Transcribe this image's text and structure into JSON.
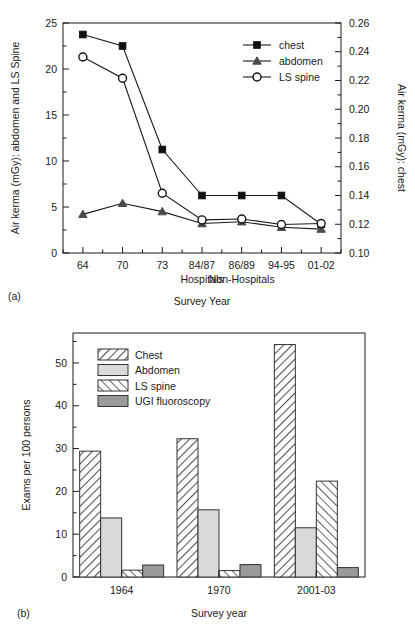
{
  "figure": {
    "panel_a_label": "(a)",
    "panel_b_label": "(b)"
  },
  "chart_data": [
    {
      "id": "panel_a",
      "type": "line",
      "title": "",
      "xlabel": "Survey Year",
      "ylabel": "Air kerma (mGy): abdomen and LS Spine",
      "y2label": "Air kerma (mGy): chest",
      "categories": [
        "64",
        "70",
        "73",
        "84/87",
        "86/89",
        "94-95",
        "01-02"
      ],
      "group_labels": [
        {
          "text": "Hospitals",
          "under": "84/87"
        },
        {
          "text": "Non-Hospitals",
          "under": "86/89"
        }
      ],
      "ylim": [
        0,
        25
      ],
      "yticks": [
        0,
        5,
        10,
        15,
        20,
        25
      ],
      "ytick_labels": [
        "0",
        "5",
        "10",
        "15",
        "20",
        "25"
      ],
      "y2lim": [
        0.1,
        0.26
      ],
      "y2ticks": [
        0.1,
        0.12,
        0.14,
        0.16,
        0.18,
        0.2,
        0.22,
        0.24,
        0.26
      ],
      "y2tick_labels": [
        "0.10",
        "0.12",
        "0.14",
        "0.16",
        "0.18",
        "0.20",
        "0.22",
        "0.24",
        "0.26"
      ],
      "grid": false,
      "legend_position": "top-right",
      "series": [
        {
          "name": "chest",
          "marker": "filled-square",
          "axis": "right",
          "values": [
            0.252,
            0.244,
            0.172,
            0.14,
            0.14,
            0.14,
            0.12
          ]
        },
        {
          "name": "abdomen",
          "marker": "filled-triangle",
          "axis": "left",
          "values": [
            4.2,
            5.4,
            4.5,
            3.2,
            3.4,
            2.8,
            2.6
          ]
        },
        {
          "name": "LS spine",
          "marker": "open-circle",
          "axis": "left",
          "values": [
            21.3,
            19.0,
            6.5,
            3.6,
            3.7,
            3.1,
            3.2
          ]
        }
      ]
    },
    {
      "id": "panel_b",
      "type": "bar",
      "title": "",
      "xlabel": "Survey year",
      "ylabel": "Exams per 100 persons",
      "categories": [
        "1964",
        "1970",
        "2001-03"
      ],
      "ylim": [
        0,
        57
      ],
      "yticks": [
        0,
        10,
        20,
        30,
        40,
        50
      ],
      "ytick_labels": [
        "0",
        "10",
        "20",
        "30",
        "40",
        "50"
      ],
      "minor_yticks": [
        5,
        15,
        25,
        35,
        45,
        55
      ],
      "grid": false,
      "legend_position": "top-left",
      "series": [
        {
          "name": "Chest",
          "fill": "hatch-forward",
          "values": [
            29.4,
            32.3,
            54.3
          ]
        },
        {
          "name": "Abdomen",
          "fill": "solid-light",
          "values": [
            13.8,
            15.7,
            11.5
          ]
        },
        {
          "name": "LS spine",
          "fill": "hatch-backward",
          "values": [
            1.6,
            1.5,
            22.4
          ]
        },
        {
          "name": "UGI fluoroscopy",
          "fill": "solid-dark",
          "values": [
            2.8,
            2.9,
            2.2
          ]
        }
      ]
    }
  ],
  "colors": {
    "line": "#1a1a1a",
    "axis": "#1a1a1a",
    "bar_light": "#d9d9d9",
    "bar_dark": "#9a9a9a",
    "hatch": "#555555",
    "background": "#ffffff"
  }
}
